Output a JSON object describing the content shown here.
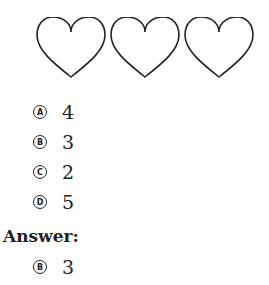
{
  "figure": {
    "shapes": [
      {
        "type": "heart-outline",
        "icon": "heart-icon"
      },
      {
        "type": "heart-outline",
        "icon": "heart-icon"
      },
      {
        "type": "heart-outline",
        "icon": "heart-icon"
      }
    ]
  },
  "options": [
    {
      "letter": "A",
      "value": "4"
    },
    {
      "letter": "B",
      "value": "3"
    },
    {
      "letter": "C",
      "value": "2"
    },
    {
      "letter": "D",
      "value": "5"
    }
  ],
  "answer": {
    "label": "Answer:",
    "letter": "B",
    "value": "3"
  }
}
